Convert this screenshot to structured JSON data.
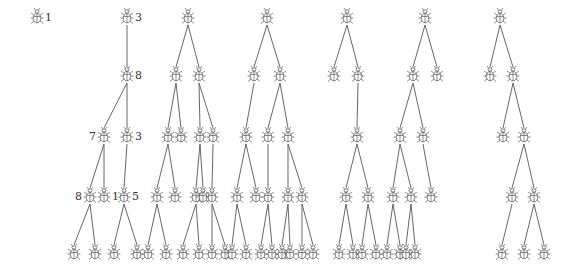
{
  "diagram": {
    "type": "forest",
    "node_icon": "bug-icon",
    "edge_color": "#555555",
    "levels_y": [
      17,
      75,
      136,
      196,
      253
    ],
    "trees": [
      {
        "name": "tree-1",
        "nodes": [
          {
            "id": "a",
            "x": 37,
            "level": 0,
            "label": "1",
            "label_side": "right"
          }
        ],
        "edges": []
      },
      {
        "name": "tree-2",
        "nodes": [
          {
            "id": "r",
            "x": 127,
            "level": 0,
            "label": "3",
            "label_side": "right"
          },
          {
            "id": "b",
            "x": 127,
            "level": 1,
            "label": "8",
            "label_side": "right"
          },
          {
            "id": "c1",
            "x": 104,
            "level": 2,
            "label": "7",
            "label_side": "left"
          },
          {
            "id": "c2",
            "x": 127,
            "level": 2,
            "label": "3",
            "label_side": "right"
          },
          {
            "id": "d1",
            "x": 90,
            "level": 3,
            "label": "8",
            "label_side": "left"
          },
          {
            "id": "d2",
            "x": 104,
            "level": 3,
            "label": "1",
            "label_side": "right"
          },
          {
            "id": "d3",
            "x": 124,
            "level": 3,
            "label": "5",
            "label_side": "right"
          },
          {
            "id": "e1",
            "x": 74,
            "level": 4
          },
          {
            "id": "e2",
            "x": 95,
            "level": 4
          },
          {
            "id": "e3",
            "x": 114,
            "level": 4
          },
          {
            "id": "e4",
            "x": 137,
            "level": 4
          }
        ],
        "edges": [
          [
            "r",
            "b"
          ],
          [
            "b",
            "c1"
          ],
          [
            "b",
            "c2"
          ],
          [
            "c1",
            "d1"
          ],
          [
            "c1",
            "d2"
          ],
          [
            "c2",
            "d3"
          ],
          [
            "d1",
            "e1"
          ],
          [
            "d1",
            "e2"
          ],
          [
            "d3",
            "e3"
          ],
          [
            "d3",
            "e4"
          ]
        ]
      },
      {
        "name": "tree-3",
        "nodes": [
          {
            "id": "r",
            "x": 188,
            "level": 0
          },
          {
            "id": "b1",
            "x": 176,
            "level": 1
          },
          {
            "id": "b2",
            "x": 199,
            "level": 1
          },
          {
            "id": "c1",
            "x": 168,
            "level": 2
          },
          {
            "id": "c2",
            "x": 181,
            "level": 2
          },
          {
            "id": "c3",
            "x": 200,
            "level": 2
          },
          {
            "id": "c4",
            "x": 213,
            "level": 2
          },
          {
            "id": "d1",
            "x": 157,
            "level": 3
          },
          {
            "id": "d2",
            "x": 175,
            "level": 3
          },
          {
            "id": "d3",
            "x": 196,
            "level": 3
          },
          {
            "id": "d4",
            "x": 203,
            "level": 3
          },
          {
            "id": "d5",
            "x": 212,
            "level": 3
          },
          {
            "id": "e1",
            "x": 148,
            "level": 4
          },
          {
            "id": "e2",
            "x": 166,
            "level": 4
          },
          {
            "id": "e3",
            "x": 183,
            "level": 4
          },
          {
            "id": "e4",
            "x": 199,
            "level": 4
          },
          {
            "id": "e5",
            "x": 212,
            "level": 4
          },
          {
            "id": "e6",
            "x": 225,
            "level": 4
          }
        ],
        "edges": [
          [
            "r",
            "b1"
          ],
          [
            "r",
            "b2"
          ],
          [
            "b1",
            "c1"
          ],
          [
            "b1",
            "c2"
          ],
          [
            "b2",
            "c3"
          ],
          [
            "b2",
            "c4"
          ],
          [
            "c1",
            "d1"
          ],
          [
            "c1",
            "d2"
          ],
          [
            "c3",
            "d3"
          ],
          [
            "c3",
            "d4"
          ],
          [
            "c4",
            "d5"
          ],
          [
            "d1",
            "e1"
          ],
          [
            "d1",
            "e2"
          ],
          [
            "d3",
            "e3"
          ],
          [
            "d3",
            "e4"
          ],
          [
            "d5",
            "e5"
          ],
          [
            "d5",
            "e6"
          ]
        ]
      },
      {
        "name": "tree-4",
        "nodes": [
          {
            "id": "r",
            "x": 267,
            "level": 0
          },
          {
            "id": "b1",
            "x": 254,
            "level": 1
          },
          {
            "id": "b2",
            "x": 280,
            "level": 1
          },
          {
            "id": "c1",
            "x": 246,
            "level": 2
          },
          {
            "id": "c2",
            "x": 268,
            "level": 2
          },
          {
            "id": "c3",
            "x": 288,
            "level": 2
          },
          {
            "id": "d1",
            "x": 237,
            "level": 3
          },
          {
            "id": "d2",
            "x": 256,
            "level": 3
          },
          {
            "id": "d3",
            "x": 268,
            "level": 3
          },
          {
            "id": "d4",
            "x": 288,
            "level": 3
          },
          {
            "id": "d5",
            "x": 302,
            "level": 3
          },
          {
            "id": "e1",
            "x": 232,
            "level": 4
          },
          {
            "id": "e2",
            "x": 246,
            "level": 4
          },
          {
            "id": "e3",
            "x": 261,
            "level": 4
          },
          {
            "id": "e4",
            "x": 272,
            "level": 4
          },
          {
            "id": "e5",
            "x": 282,
            "level": 4
          },
          {
            "id": "e6",
            "x": 290,
            "level": 4
          },
          {
            "id": "e7",
            "x": 302,
            "level": 4
          },
          {
            "id": "e8",
            "x": 313,
            "level": 4
          }
        ],
        "edges": [
          [
            "r",
            "b1"
          ],
          [
            "r",
            "b2"
          ],
          [
            "b1",
            "c1"
          ],
          [
            "b2",
            "c2"
          ],
          [
            "b2",
            "c3"
          ],
          [
            "c1",
            "d1"
          ],
          [
            "c1",
            "d2"
          ],
          [
            "c2",
            "d3"
          ],
          [
            "c3",
            "d4"
          ],
          [
            "c3",
            "d5"
          ],
          [
            "d1",
            "e1"
          ],
          [
            "d1",
            "e2"
          ],
          [
            "d3",
            "e3"
          ],
          [
            "d3",
            "e4"
          ],
          [
            "d4",
            "e5"
          ],
          [
            "d4",
            "e6"
          ],
          [
            "d5",
            "e7"
          ],
          [
            "d5",
            "e8"
          ]
        ]
      },
      {
        "name": "tree-5",
        "nodes": [
          {
            "id": "r",
            "x": 347,
            "level": 0
          },
          {
            "id": "b1",
            "x": 334,
            "level": 1
          },
          {
            "id": "b2",
            "x": 358,
            "level": 1
          },
          {
            "id": "c1",
            "x": 357,
            "level": 2
          },
          {
            "id": "d1",
            "x": 346,
            "level": 3
          },
          {
            "id": "d2",
            "x": 368,
            "level": 3
          },
          {
            "id": "e1",
            "x": 339,
            "level": 4
          },
          {
            "id": "e2",
            "x": 353,
            "level": 4
          },
          {
            "id": "e3",
            "x": 362,
            "level": 4
          },
          {
            "id": "e4",
            "x": 376,
            "level": 4
          }
        ],
        "edges": [
          [
            "r",
            "b1"
          ],
          [
            "r",
            "b2"
          ],
          [
            "b2",
            "c1"
          ],
          [
            "c1",
            "d1"
          ],
          [
            "c1",
            "d2"
          ],
          [
            "d1",
            "e1"
          ],
          [
            "d1",
            "e2"
          ],
          [
            "d2",
            "e3"
          ],
          [
            "d2",
            "e4"
          ]
        ]
      },
      {
        "name": "tree-6",
        "nodes": [
          {
            "id": "r",
            "x": 425,
            "level": 0
          },
          {
            "id": "b1",
            "x": 413,
            "level": 1
          },
          {
            "id": "b2",
            "x": 437,
            "level": 1
          },
          {
            "id": "c1",
            "x": 400,
            "level": 2
          },
          {
            "id": "c2",
            "x": 423,
            "level": 2
          },
          {
            "id": "d1",
            "x": 393,
            "level": 3
          },
          {
            "id": "d2",
            "x": 411,
            "level": 3
          },
          {
            "id": "d3",
            "x": 431,
            "level": 3
          },
          {
            "id": "e1",
            "x": 387,
            "level": 4
          },
          {
            "id": "e2",
            "x": 400,
            "level": 4
          },
          {
            "id": "e3",
            "x": 406,
            "level": 4
          },
          {
            "id": "e4",
            "x": 415,
            "level": 4
          }
        ],
        "edges": [
          [
            "r",
            "b1"
          ],
          [
            "r",
            "b2"
          ],
          [
            "b1",
            "c1"
          ],
          [
            "b1",
            "c2"
          ],
          [
            "c1",
            "d1"
          ],
          [
            "c1",
            "d2"
          ],
          [
            "c2",
            "d3"
          ],
          [
            "d1",
            "e1"
          ],
          [
            "d1",
            "e2"
          ],
          [
            "d2",
            "e3"
          ],
          [
            "d2",
            "e4"
          ]
        ]
      },
      {
        "name": "tree-7",
        "nodes": [
          {
            "id": "r",
            "x": 500,
            "level": 0
          },
          {
            "id": "b1",
            "x": 490,
            "level": 1
          },
          {
            "id": "b2",
            "x": 513,
            "level": 1
          },
          {
            "id": "c1",
            "x": 503,
            "level": 2
          },
          {
            "id": "c2",
            "x": 524,
            "level": 2
          },
          {
            "id": "d1",
            "x": 512,
            "level": 3
          },
          {
            "id": "d2",
            "x": 534,
            "level": 3
          },
          {
            "id": "e1",
            "x": 502,
            "level": 4
          },
          {
            "id": "e2",
            "x": 524,
            "level": 4
          },
          {
            "id": "e3",
            "x": 544,
            "level": 4
          }
        ],
        "edges": [
          [
            "r",
            "b1"
          ],
          [
            "r",
            "b2"
          ],
          [
            "b2",
            "c1"
          ],
          [
            "b2",
            "c2"
          ],
          [
            "c2",
            "d1"
          ],
          [
            "c2",
            "d2"
          ],
          [
            "d1",
            "e1"
          ],
          [
            "d2",
            "e2"
          ],
          [
            "d2",
            "e3"
          ]
        ]
      }
    ]
  }
}
